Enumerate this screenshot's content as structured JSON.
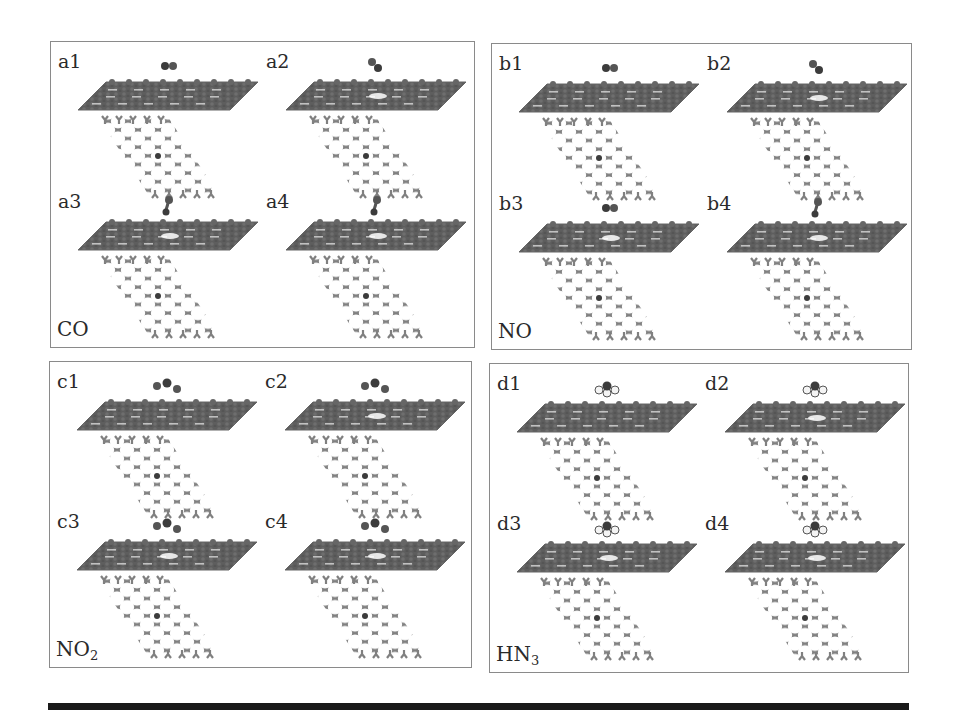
{
  "figure": {
    "panels": [
      {
        "id": "a",
        "gas": "CO",
        "gas_sub": "",
        "subpanels": [
          {
            "label": "a1",
            "molecule": "diatomic-horizontal",
            "defect": false
          },
          {
            "label": "a2",
            "molecule": "diatomic-tilted",
            "defect": true
          },
          {
            "label": "a3",
            "molecule": "diatomic-vertical",
            "defect": true
          },
          {
            "label": "a4",
            "molecule": "diatomic-vertical",
            "defect": true
          }
        ]
      },
      {
        "id": "b",
        "gas": "NO",
        "gas_sub": "",
        "subpanels": [
          {
            "label": "b1",
            "molecule": "diatomic-horizontal",
            "defect": false
          },
          {
            "label": "b2",
            "molecule": "diatomic-tilted",
            "defect": true
          },
          {
            "label": "b3",
            "molecule": "diatomic-horizontal",
            "defect": true
          },
          {
            "label": "b4",
            "molecule": "diatomic-vertical",
            "defect": true
          }
        ]
      },
      {
        "id": "c",
        "gas": "NO",
        "gas_sub": "2",
        "subpanels": [
          {
            "label": "c1",
            "molecule": "triatomic-bent",
            "defect": false
          },
          {
            "label": "c2",
            "molecule": "triatomic-bent",
            "defect": true
          },
          {
            "label": "c3",
            "molecule": "triatomic-bent",
            "defect": true
          },
          {
            "label": "c4",
            "molecule": "triatomic-bent",
            "defect": true
          }
        ]
      },
      {
        "id": "d",
        "gas": "HN",
        "gas_sub": "3",
        "subpanels": [
          {
            "label": "d1",
            "molecule": "pyramidal",
            "defect": false
          },
          {
            "label": "d2",
            "molecule": "pyramidal",
            "defect": true
          },
          {
            "label": "d3",
            "molecule": "pyramidal",
            "defect": true
          },
          {
            "label": "d4",
            "molecule": "pyramidal",
            "defect": true
          }
        ]
      }
    ],
    "colors": {
      "lattice": "#808080",
      "slab": "#5e5e5e",
      "molecule": "#3c3c3c",
      "hydrogen": "#f4f4f4",
      "border": "#8a8a8a",
      "bottom_bar": "#1a1a1a"
    }
  }
}
